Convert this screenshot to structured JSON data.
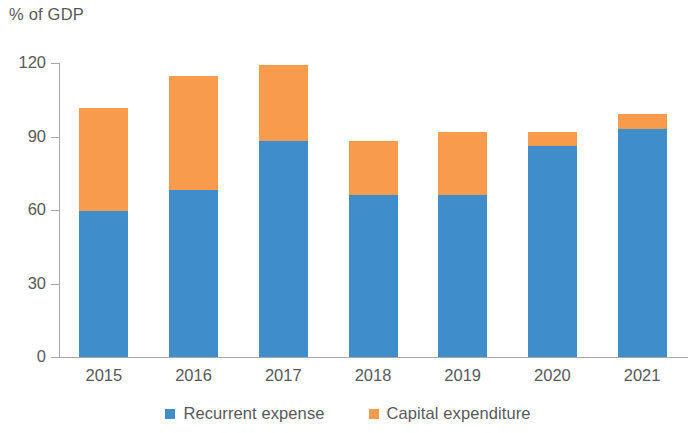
{
  "chart_data": {
    "type": "bar",
    "stacked": true,
    "title": "",
    "subtitle": "",
    "xlabel": "",
    "ylabel": "% of GDP",
    "categories": [
      "2015",
      "2016",
      "2017",
      "2018",
      "2019",
      "2020",
      "2021"
    ],
    "series": [
      {
        "name": "Recurrent expense",
        "color": "#3f8ecb",
        "values": [
          59.5,
          68,
          88,
          66,
          66,
          86,
          93
        ]
      },
      {
        "name": "Capital expenditure",
        "color": "#f89b4c",
        "values": [
          42,
          46.5,
          31,
          22,
          26,
          6,
          6
        ]
      }
    ],
    "totals": [
      101.5,
      114.5,
      119,
      88,
      92,
      92,
      99
    ],
    "ylim": [
      0,
      120
    ],
    "yticks": [
      0,
      30,
      60,
      90,
      120
    ],
    "ytick_labels": [
      "0",
      "30",
      "60",
      "90",
      "120"
    ],
    "grid": false,
    "legend_position": "bottom"
  },
  "axis": {
    "unit_label": "% of GDP"
  },
  "legend": {
    "items": [
      {
        "label": "Recurrent expense",
        "color": "#3f8ecb",
        "swatch": "square-swatch-blue"
      },
      {
        "label": "Capital expenditure",
        "color": "#f89b4c",
        "swatch": "square-swatch-orange"
      }
    ]
  }
}
